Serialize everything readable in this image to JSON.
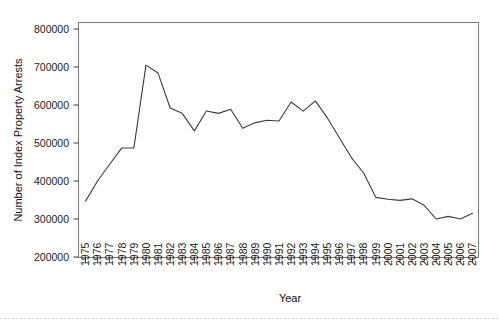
{
  "chart_data": {
    "type": "line",
    "title": "",
    "xlabel": "Year",
    "ylabel": "Number of Index Property Arrests",
    "xlim": [
      1975,
      2007
    ],
    "ylim": [
      200000,
      800000
    ],
    "ytick_values": [
      200000,
      300000,
      400000,
      500000,
      600000,
      700000,
      800000
    ],
    "ytick_labels": [
      "200000",
      "300000",
      "400000",
      "500000",
      "600000",
      "700000",
      "800000"
    ],
    "grid": false,
    "legend": "none",
    "categories": [
      "1975",
      "1976",
      "1977",
      "1978",
      "1979",
      "1980",
      "1981",
      "1982",
      "1983",
      "1984",
      "1985",
      "1986",
      "1987",
      "1988",
      "1989",
      "1990",
      "1991",
      "1992",
      "1993",
      "1994",
      "1995",
      "1996",
      "1997",
      "1998",
      "1999",
      "2000",
      "2001",
      "2002",
      "2003",
      "2004",
      "2005",
      "2006",
      "2007"
    ],
    "x": [
      1975,
      1976,
      1977,
      1978,
      1979,
      1980,
      1981,
      1982,
      1983,
      1984,
      1985,
      1986,
      1987,
      1988,
      1989,
      1990,
      1991,
      1992,
      1993,
      1994,
      1995,
      1996,
      1997,
      1998,
      1999,
      2000,
      2001,
      2002,
      2003,
      2004,
      2005,
      2006,
      2007
    ],
    "values": [
      347000,
      400000,
      444000,
      487000,
      487000,
      705000,
      684000,
      592000,
      578000,
      532000,
      584000,
      578000,
      589000,
      539000,
      553000,
      560000,
      558000,
      608000,
      584000,
      611000,
      566000,
      513000,
      461000,
      421000,
      357000,
      352000,
      349000,
      353000,
      336000,
      300000,
      307000,
      300000,
      315000
    ],
    "series": [
      {
        "name": "Index Property Arrests",
        "color": "#3c3c3c",
        "values": [
          347000,
          400000,
          444000,
          487000,
          487000,
          705000,
          684000,
          592000,
          578000,
          532000,
          584000,
          578000,
          589000,
          539000,
          553000,
          560000,
          558000,
          608000,
          584000,
          611000,
          566000,
          513000,
          461000,
          421000,
          357000,
          352000,
          349000,
          353000,
          336000,
          300000,
          307000,
          300000,
          315000
        ]
      }
    ]
  },
  "axes": {
    "x_title": "Year",
    "y_title": "Number of Index Property Arrests"
  }
}
